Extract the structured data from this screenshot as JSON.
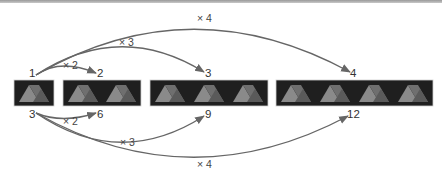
{
  "diagram": {
    "colors": {
      "box_fill": "#1f1f1f",
      "triangle_light": "#8a8a8a",
      "triangle_dark": "#5e5e5e",
      "arrow": "#666666",
      "text": "#333333",
      "top_bar": "#a8a8a8"
    },
    "boxes": [
      {
        "tiles": 1,
        "top_label": "1",
        "bottom_label": "3"
      },
      {
        "tiles": 2,
        "top_label": "2",
        "bottom_label": "6"
      },
      {
        "tiles": 3,
        "top_label": "3",
        "bottom_label": "9"
      },
      {
        "tiles": 4,
        "top_label": "4",
        "bottom_label": "12"
      }
    ],
    "top_arrows": [
      {
        "from": "1",
        "to": "2",
        "label": "× 2"
      },
      {
        "from": "1",
        "to": "3",
        "label": "× 3"
      },
      {
        "from": "1",
        "to": "4",
        "label": "× 4"
      }
    ],
    "bottom_arrows": [
      {
        "from": "3",
        "to": "6",
        "label": "× 2"
      },
      {
        "from": "3",
        "to": "9",
        "label": "× 3"
      },
      {
        "from": "3",
        "to": "12",
        "label": "× 4"
      }
    ]
  }
}
